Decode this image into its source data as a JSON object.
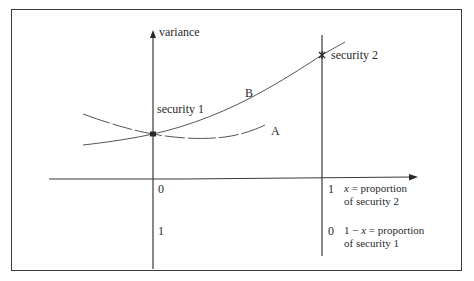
{
  "diagram": {
    "y_axis_label": "variance",
    "point_labels": {
      "security1": "security 1",
      "security2": "security 2"
    },
    "curve_labels": {
      "A": "A",
      "B": "B"
    },
    "x_axis": {
      "tick_top_left": "0",
      "tick_top_right": "1",
      "tick_bottom_left": "1",
      "tick_bottom_right": "0",
      "top_desc_var": "x",
      "top_desc_line1_rest": " = proportion",
      "top_desc_line2": "of security 2",
      "bottom_desc_prefix": "1 − ",
      "bottom_desc_var": "x",
      "bottom_desc_line1_rest": " = proportion",
      "bottom_desc_line2": "of security 1"
    },
    "colors": {
      "line": "#3a3a3a",
      "curve": "#555555",
      "frame": "#3a3a3a"
    }
  }
}
